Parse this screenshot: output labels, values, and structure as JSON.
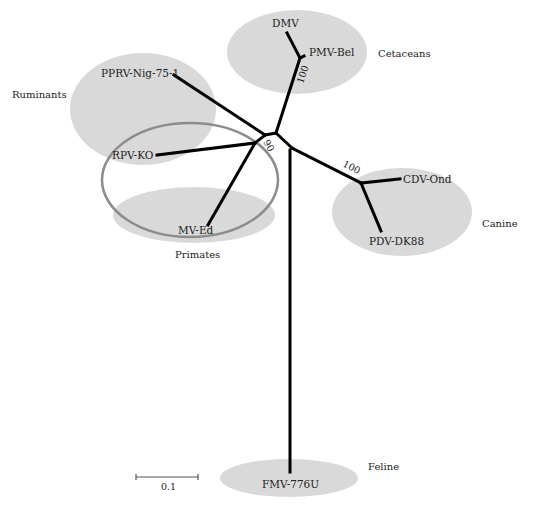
{
  "diagram": {
    "type": "unrooted phylogenetic tree",
    "colors": {
      "branch": "#000000",
      "cluster_fill": "#d9d9d9",
      "outline": "#8c8c8c",
      "text": "#222222"
    },
    "taxa": {
      "dmv": "DMV",
      "pmv": "PMV-Bel",
      "pprv": "PPRV-Nig-75-1",
      "rpv": "RPV-KO",
      "mv": "MV-Ed",
      "cdv": "CDV-Ond",
      "pdv": "PDV-DK88",
      "fmv": "FMV-776U"
    },
    "groups": {
      "cetaceans": "Cetaceans",
      "ruminants": "Ruminants",
      "primates": "Primates",
      "canine": "Canine",
      "feline": "Feline"
    },
    "bootstrap": {
      "cetacean_node": "100",
      "center_node": "90",
      "canine_node": "100"
    },
    "scale_bar": {
      "label": "0.1"
    }
  }
}
